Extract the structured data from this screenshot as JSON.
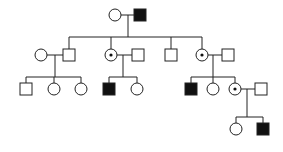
{
  "diagram": {
    "type": "pedigree",
    "legend_symbols": {
      "square": "male",
      "circle": "female",
      "filled": "affected",
      "dotted_circle": "carrier female"
    },
    "generations": [
      {
        "gen": "I",
        "individuals": [
          {
            "id": "I-1",
            "sex": "female",
            "status": "unaffected"
          },
          {
            "id": "I-2",
            "sex": "male",
            "status": "affected"
          }
        ]
      },
      {
        "gen": "II",
        "individuals": [
          {
            "id": "II-1",
            "sex": "female",
            "status": "unaffected",
            "note": "spouse"
          },
          {
            "id": "II-2",
            "sex": "male",
            "status": "unaffected"
          },
          {
            "id": "II-3",
            "sex": "female",
            "status": "carrier"
          },
          {
            "id": "II-4",
            "sex": "male",
            "status": "unaffected",
            "note": "spouse"
          },
          {
            "id": "II-5",
            "sex": "male",
            "status": "unaffected"
          },
          {
            "id": "II-6",
            "sex": "female",
            "status": "carrier"
          },
          {
            "id": "II-7",
            "sex": "male",
            "status": "unaffected",
            "note": "spouse"
          }
        ]
      },
      {
        "gen": "III",
        "individuals": [
          {
            "id": "III-1",
            "sex": "male",
            "status": "unaffected"
          },
          {
            "id": "III-2",
            "sex": "female",
            "status": "unaffected"
          },
          {
            "id": "III-3",
            "sex": "female",
            "status": "unaffected"
          },
          {
            "id": "III-4",
            "sex": "male",
            "status": "affected"
          },
          {
            "id": "III-5",
            "sex": "female",
            "status": "unaffected"
          },
          {
            "id": "III-6",
            "sex": "male",
            "status": "affected"
          },
          {
            "id": "III-7",
            "sex": "female",
            "status": "unaffected"
          },
          {
            "id": "III-8",
            "sex": "female",
            "status": "carrier"
          },
          {
            "id": "III-9",
            "sex": "male",
            "status": "unaffected",
            "note": "spouse"
          }
        ]
      },
      {
        "gen": "IV",
        "individuals": [
          {
            "id": "IV-1",
            "sex": "female",
            "status": "unaffected"
          },
          {
            "id": "IV-2",
            "sex": "male",
            "status": "affected"
          }
        ]
      }
    ]
  }
}
